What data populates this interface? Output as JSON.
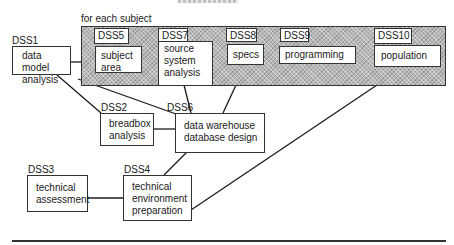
{
  "diagram": {
    "group_label": "for each subject",
    "group_fill": "#b8b8b8",
    "line_color": "#1a1a1a",
    "nodes": [
      {
        "id": "DSS1",
        "tag": "DSS1",
        "text": "data model\nanalysis"
      },
      {
        "id": "DSS2",
        "tag": "DSS2",
        "text": "breadbox\nanalysis"
      },
      {
        "id": "DSS3",
        "tag": "DSS3",
        "text": "technical\nassessment"
      },
      {
        "id": "DSS4",
        "tag": "DSS4",
        "text": "technical\nenvironment\npreparation"
      },
      {
        "id": "DSS5",
        "tag": "DSS5",
        "text": "subject\narea"
      },
      {
        "id": "DSS6",
        "tag": "DSS6",
        "text": "data warehouse\ndatabase design"
      },
      {
        "id": "DSS7",
        "tag": "DSS7",
        "text": "source\nsystem\nanalysis"
      },
      {
        "id": "DSS8",
        "tag": "DSS8",
        "text": "specs"
      },
      {
        "id": "DSS9",
        "tag": "DSS9",
        "text": "programming"
      },
      {
        "id": "DSS10",
        "tag": "DSS10",
        "text": "population"
      }
    ],
    "edges": [
      [
        "DSS1",
        "for each subject group"
      ],
      [
        "DSS1",
        "DSS2"
      ],
      [
        "DSS1",
        "DSS6"
      ],
      [
        "DSS2",
        "DSS6"
      ],
      [
        "DSS7",
        "DSS6"
      ],
      [
        "DSS8",
        "DSS6"
      ],
      [
        "DSS6",
        "DSS4"
      ],
      [
        "DSS3",
        "DSS4"
      ],
      [
        "DSS10",
        "DSS4"
      ]
    ]
  }
}
